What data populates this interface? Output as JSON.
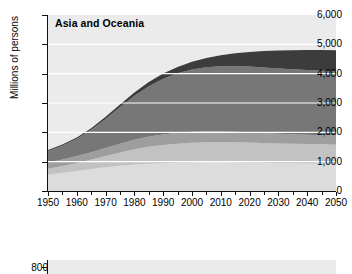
{
  "chart_data": {
    "type": "area",
    "stacked": true,
    "title": "Asia and Oceania",
    "xlabel": "",
    "ylabel": "Millions of persons",
    "xlim": [
      1950,
      2050
    ],
    "ylim": [
      0,
      6000
    ],
    "grid": "horizontal-white",
    "legend": "none",
    "y_ticks": [
      "0",
      "1,000",
      "2,000",
      "3,000",
      "4,000",
      "5,000",
      "6,000"
    ],
    "y_tick_values": [
      0,
      1000,
      2000,
      3000,
      4000,
      5000,
      6000
    ],
    "x_ticks": [
      "1950",
      "1960",
      "1970",
      "1980",
      "1990",
      "2000",
      "2010",
      "2020",
      "2030",
      "2040",
      "2050"
    ],
    "x_tick_values": [
      1950,
      1960,
      1970,
      1980,
      1990,
      2000,
      2010,
      2020,
      2030,
      2040,
      2050
    ],
    "x_minor_step": 5,
    "x": [
      1950,
      1955,
      1960,
      1965,
      1970,
      1975,
      1980,
      1985,
      1990,
      1995,
      2000,
      2005,
      2010,
      2015,
      2020,
      2025,
      2030,
      2035,
      2040,
      2045,
      2050
    ],
    "series": [
      {
        "name": "band-1",
        "color": "#dcdcdc",
        "values": [
          560,
          620,
          680,
          750,
          810,
          860,
          900,
          930,
          950,
          965,
          975,
          980,
          980,
          975,
          970,
          960,
          950,
          945,
          940,
          935,
          930
        ]
      },
      {
        "name": "band-2",
        "color": "#c2c2c2",
        "values": [
          200,
          230,
          270,
          320,
          380,
          450,
          520,
          580,
          620,
          650,
          670,
          680,
          685,
          685,
          680,
          675,
          670,
          665,
          660,
          655,
          650
        ]
      },
      {
        "name": "band-3",
        "color": "#9e9e9e",
        "values": [
          215,
          225,
          240,
          255,
          275,
          300,
          325,
          345,
          360,
          370,
          375,
          375,
          370,
          362,
          352,
          340,
          330,
          322,
          316,
          312,
          310
        ]
      },
      {
        "name": "band-4",
        "color": "#777777",
        "values": [
          390,
          470,
          590,
          760,
          990,
          1250,
          1500,
          1720,
          1900,
          2030,
          2120,
          2180,
          2215,
          2235,
          2240,
          2235,
          2225,
          2215,
          2205,
          2198,
          2195
        ]
      },
      {
        "name": "band-5",
        "color": "#3c3c3c",
        "values": [
          35,
          40,
          48,
          58,
          72,
          90,
          112,
          140,
          175,
          215,
          262,
          315,
          375,
          437,
          500,
          560,
          613,
          655,
          686,
          705,
          715
        ]
      }
    ],
    "totals": [
      1400,
      1585,
      1828,
      2143,
      2527,
      2950,
      3357,
      3715,
      4005,
      4230,
      4402,
      4530,
      4625,
      4694,
      4742,
      4770,
      4788,
      4802,
      4807,
      4805,
      4800
    ],
    "background": "#ebebeb",
    "gridline_color": "#ffffff"
  },
  "chart2": {
    "type": "area",
    "y_tick_label": "800",
    "note": "partially visible chart below"
  }
}
